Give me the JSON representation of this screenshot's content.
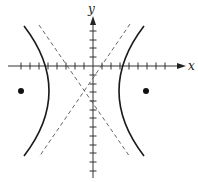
{
  "figure": {
    "type": "hyperbola-graph",
    "axes": {
      "x_label": "x",
      "y_label": "y",
      "origin_px": [
        93,
        66
      ],
      "tick_spacing_px": 9,
      "x_ticks_px": [
        21,
        30,
        39,
        48,
        57,
        66,
        75,
        84,
        102,
        111,
        120,
        129,
        138,
        147,
        156,
        165
      ],
      "y_ticks_px": [
        31,
        40,
        48,
        57,
        75,
        84,
        92,
        101,
        110,
        118,
        127,
        136,
        145,
        153,
        162,
        171
      ]
    },
    "hyperbola": {
      "orientation": "horizontal",
      "center_px": [
        84,
        91
      ],
      "left_branch": {
        "top": [
          24,
          26
        ],
        "vertex": [
          49,
          91
        ],
        "bottom": [
          24,
          156
        ]
      },
      "right_branch": {
        "top": [
          144,
          26
        ],
        "vertex": [
          119,
          91
        ],
        "bottom": [
          144,
          156
        ]
      }
    },
    "asymptotes": [
      {
        "from": [
          39,
          25
        ],
        "to": [
          130,
          157
        ],
        "style": "dashed"
      },
      {
        "from": [
          130,
          24
        ],
        "to": [
          39,
          157
        ],
        "style": "dashed"
      }
    ],
    "foci": [
      {
        "px": [
          21,
          91
        ]
      },
      {
        "px": [
          146,
          91
        ]
      }
    ],
    "colors": {
      "curve": "#1a1a1a",
      "axis": "#333333",
      "asymptote": "#555555",
      "focus": "#111111"
    }
  }
}
